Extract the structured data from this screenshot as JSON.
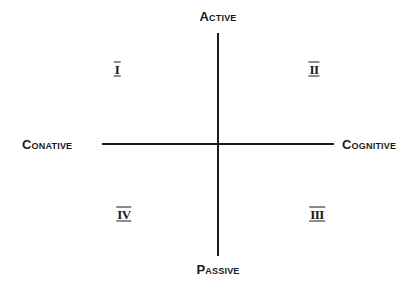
{
  "diagram": {
    "axes": {
      "top": "Active",
      "bottom": "Passive",
      "left": "Conative",
      "right": "Cognitive"
    },
    "quadrants": [
      {
        "position": "top-left",
        "label": "I"
      },
      {
        "position": "top-right",
        "label": "II"
      },
      {
        "position": "bottom-right",
        "label": "III"
      },
      {
        "position": "bottom-left",
        "label": "IV"
      }
    ],
    "colors": {
      "ink": "#1a1a1a",
      "background": "#ffffff"
    }
  }
}
